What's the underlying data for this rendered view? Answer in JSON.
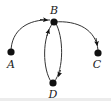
{
  "diagram": {
    "type": "directed-graph",
    "nodes": [
      {
        "id": "A",
        "label": "A",
        "x": 11,
        "y": 52,
        "label_x": 11,
        "label_y": 68
      },
      {
        "id": "B",
        "label": "B",
        "x": 54,
        "y": 22,
        "label_x": 54,
        "label_y": 14
      },
      {
        "id": "C",
        "label": "C",
        "x": 98,
        "y": 53,
        "label_x": 97,
        "label_y": 68
      },
      {
        "id": "D",
        "label": "D",
        "x": 53,
        "y": 83,
        "label_x": 53,
        "label_y": 98
      }
    ],
    "edges": [
      {
        "from": "A",
        "to": "B"
      },
      {
        "from": "B",
        "to": "C"
      },
      {
        "from": "B",
        "to": "D"
      },
      {
        "from": "D",
        "to": "B"
      }
    ],
    "colors": {
      "node": "#111111",
      "edge": "#333333",
      "label": "#1a1a1a"
    }
  }
}
